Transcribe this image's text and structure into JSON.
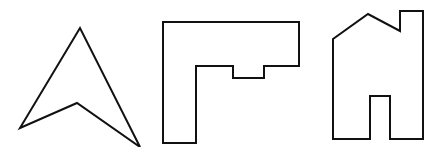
{
  "figure": {
    "stroke_color": "#111111",
    "background_color": "#ffffff",
    "shapes": [
      {
        "id": "arrowhead",
        "label": "arrowhead shape"
      },
      {
        "id": "l-shape",
        "label": "L-shaped polygon with notch"
      },
      {
        "id": "house",
        "label": "house shape with chimney and door"
      }
    ]
  }
}
